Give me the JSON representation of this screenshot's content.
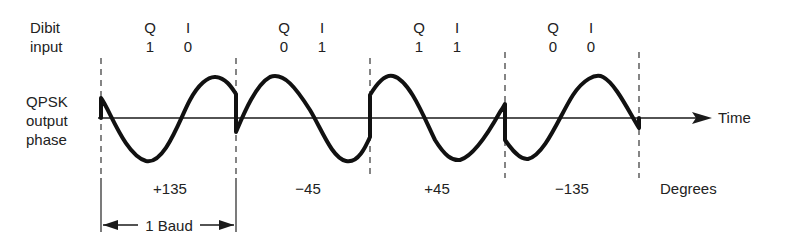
{
  "labels": {
    "dibit_line1": "Dibit",
    "dibit_line2": "input",
    "qpsk_line1": "QPSK",
    "qpsk_line2": "output",
    "qpsk_line3": "phase",
    "time": "Time",
    "degrees": "Degrees",
    "baud": "1 Baud"
  },
  "symbols": [
    {
      "q_label": "Q",
      "i_label": "I",
      "q": "1",
      "i": "0",
      "phase": "+135"
    },
    {
      "q_label": "Q",
      "i_label": "I",
      "q": "0",
      "i": "1",
      "phase": "−45"
    },
    {
      "q_label": "Q",
      "i_label": "I",
      "q": "1",
      "i": "1",
      "phase": "+45"
    },
    {
      "q_label": "Q",
      "i_label": "I",
      "q": "0",
      "i": "0",
      "phase": "−135"
    }
  ],
  "colors": {
    "ink": "#1a1a1a",
    "background": "#ffffff"
  }
}
